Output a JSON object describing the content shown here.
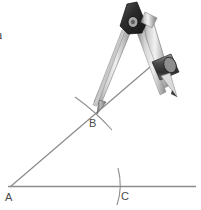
{
  "figure": {
    "caption_lines": [
      "tion",
      "dle"
    ],
    "background_color": "#ffffff",
    "line_color": "#8d8d8d",
    "label_color": "#4a4a4a",
    "metal_light": "#e8e8e8",
    "metal_mid": "#b5b5b5",
    "metal_dark": "#6e6e6e",
    "hinge_color": "#3b3b3b"
  },
  "geometry": {
    "points": [
      {
        "id": "A",
        "label": "A",
        "x": 10,
        "y": 188
      },
      {
        "id": "B",
        "label": "B",
        "x": 95,
        "y": 110
      },
      {
        "id": "C",
        "label": "C",
        "x": 120,
        "y": 188
      }
    ],
    "baseline": {
      "label": "horizontal-baseline",
      "x1": 8,
      "y1": 186,
      "x2": 196,
      "y2": 186
    },
    "ray": {
      "label": "ray-from-A-through-B",
      "x1": 10,
      "y1": 187,
      "x2": 157,
      "y2": 61
    },
    "arcs": [
      {
        "id": "arc-at-B",
        "label": "arc-crossing-ray-at-B"
      },
      {
        "id": "arc-at-C",
        "label": "arc-crossing-baseline-at-C"
      }
    ]
  },
  "compass": {
    "name": "drafting-compass",
    "hinge_label": "compass-hinge",
    "needle_leg_label": "compass-needle-leg",
    "pencil_leg_label": "compass-pencil-leg",
    "pencil_clamp_label": "compass-pencil-clamp",
    "needle_tip": {
      "x": 95,
      "y": 110
    },
    "pencil_tip": {
      "x": 176,
      "y": 96
    },
    "hinge": {
      "x": 131,
      "y": 22
    }
  }
}
